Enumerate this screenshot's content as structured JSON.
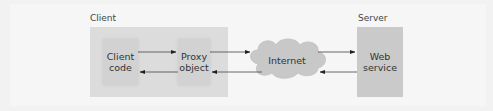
{
  "diagram": {
    "groups": {
      "client": {
        "label": "Client"
      },
      "server": {
        "label": "Server"
      }
    },
    "nodes": [
      {
        "id": "client-code",
        "label_lines": [
          "Client",
          "code"
        ]
      },
      {
        "id": "proxy-object",
        "label_lines": [
          "Proxy",
          "object"
        ]
      },
      {
        "id": "internet",
        "label": "Internet",
        "shape": "cloud"
      },
      {
        "id": "web-service",
        "label_lines": [
          "Web",
          "service"
        ]
      }
    ],
    "edges": [
      {
        "from": "client-code",
        "to": "proxy-object",
        "direction": "right"
      },
      {
        "from": "proxy-object",
        "to": "client-code",
        "direction": "left"
      },
      {
        "from": "proxy-object",
        "to": "internet",
        "direction": "right"
      },
      {
        "from": "internet",
        "to": "proxy-object",
        "direction": "left"
      },
      {
        "from": "internet",
        "to": "web-service",
        "direction": "right"
      },
      {
        "from": "web-service",
        "to": "internet",
        "direction": "left"
      }
    ],
    "colors": {
      "group_fill": "#dcdcdc",
      "node_fill": "#d2d2d2",
      "server_fill": "#cacaca",
      "cloud_fill": "#c8c8c8",
      "arrow": "#222222"
    }
  }
}
